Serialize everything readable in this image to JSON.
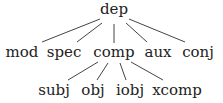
{
  "tree": {
    "root": {
      "label": "dep",
      "x": 114,
      "y": 2
    },
    "level1": [
      {
        "label": "mod",
        "x": 22,
        "y": 43
      },
      {
        "label": "spec",
        "x": 64,
        "y": 43
      },
      {
        "label": "comp",
        "x": 114,
        "y": 43
      },
      {
        "label": "aux",
        "x": 158,
        "y": 43
      },
      {
        "label": "conj",
        "x": 198,
        "y": 43
      }
    ],
    "level2": [
      {
        "label": "subj",
        "x": 54,
        "y": 82
      },
      {
        "label": "obj",
        "x": 93,
        "y": 82
      },
      {
        "label": "iobj",
        "x": 130,
        "y": 82
      },
      {
        "label": "xcomp",
        "x": 177,
        "y": 82
      }
    ],
    "edge_color": "#444444"
  }
}
